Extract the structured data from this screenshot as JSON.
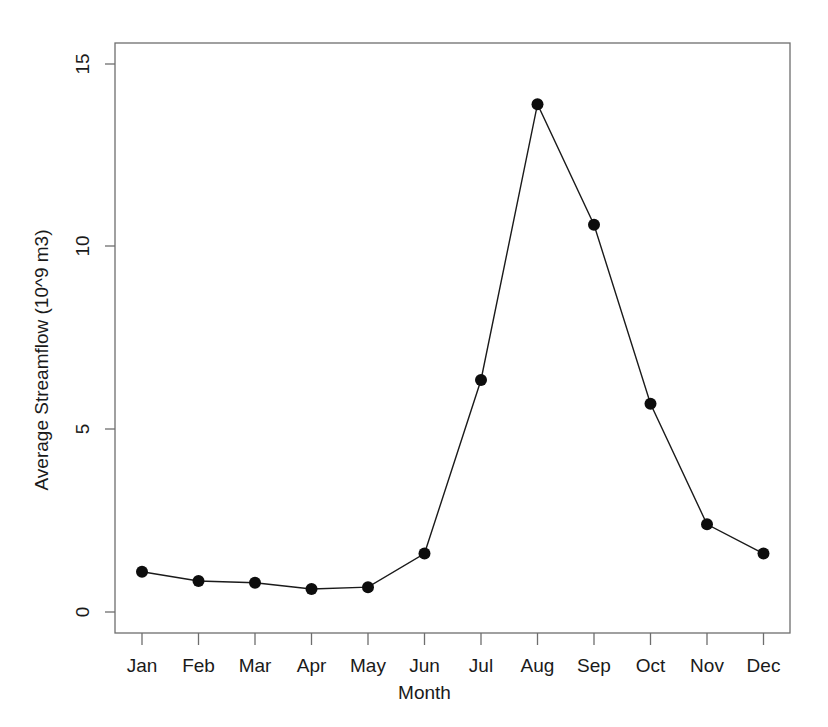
{
  "chart_data": {
    "type": "line",
    "title": "",
    "xlabel": "Month",
    "ylabel": "Average Streamflow (10^9 m3)",
    "categories": [
      "Jan",
      "Feb",
      "Mar",
      "Apr",
      "May",
      "Jun",
      "Jul",
      "Aug",
      "Sep",
      "Oct",
      "Nov",
      "Dec"
    ],
    "values": [
      1.1,
      0.85,
      0.8,
      0.63,
      0.68,
      1.6,
      6.35,
      13.9,
      10.6,
      5.7,
      2.4,
      1.6
    ],
    "series": [
      {
        "name": "Average Streamflow",
        "values": [
          1.1,
          0.85,
          0.8,
          0.63,
          0.68,
          1.6,
          6.35,
          13.9,
          10.6,
          5.7,
          2.4,
          1.6
        ]
      }
    ],
    "ylim": [
      -0.6,
      16.2
    ],
    "yticks": [
      0,
      5,
      10,
      15
    ],
    "ytick_labels": [
      "0",
      "5",
      "10",
      "15"
    ],
    "xtick_labels": [
      "Jan",
      "Feb",
      "Mar",
      "Apr",
      "May",
      "Jun",
      "Jul",
      "Aug",
      "Sep",
      "Oct",
      "Nov",
      "Dec"
    ],
    "grid": false,
    "legend": "none",
    "marker": "filled-circle",
    "line_color": "#1a1a1a",
    "marker_color": "#0d0d0d",
    "background_color": "#ffffff",
    "axis_color": "#6e6e6e"
  },
  "axis": {
    "y_title": "Average Streamflow (10^9 m3)",
    "x_title": "Month",
    "y_ticks": [
      {
        "label": "15"
      },
      {
        "label": "10"
      },
      {
        "label": "5"
      },
      {
        "label": "0"
      }
    ],
    "x_ticks": [
      {
        "label": "Jan"
      },
      {
        "label": "Feb"
      },
      {
        "label": "Mar"
      },
      {
        "label": "Apr"
      },
      {
        "label": "May"
      },
      {
        "label": "Jun"
      },
      {
        "label": "Jul"
      },
      {
        "label": "Aug"
      },
      {
        "label": "Sep"
      },
      {
        "label": "Oct"
      },
      {
        "label": "Nov"
      },
      {
        "label": "Dec"
      }
    ]
  }
}
